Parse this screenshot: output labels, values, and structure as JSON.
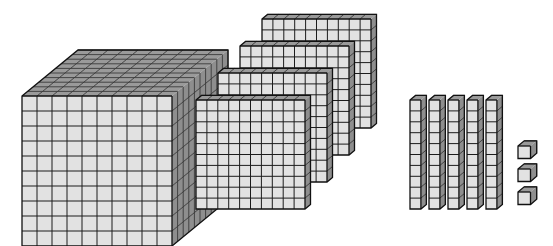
{
  "figure": {
    "background_color": "#ffffff",
    "palette": {
      "front_face": "#e2e2e2",
      "top_face": "#9a9a9a",
      "side_face": "#8e8e8e",
      "edge": "#1c1c1c",
      "outline": "#111111"
    },
    "groups": [
      {
        "name": "thousands-cube",
        "block_type": "cube",
        "count": 1,
        "unit_value": 1000,
        "group_value": 1000,
        "rows": 10,
        "cols": 10,
        "depth": 10
      },
      {
        "name": "hundreds-flats",
        "block_type": "flat",
        "count": 4,
        "unit_value": 100,
        "group_value": 400,
        "rows": 10,
        "cols": 10,
        "depth": 1
      },
      {
        "name": "tens-rods",
        "block_type": "rod",
        "count": 5,
        "unit_value": 10,
        "group_value": 50,
        "rows": 10,
        "cols": 1,
        "depth": 1
      },
      {
        "name": "ones-units",
        "block_type": "unit",
        "count": 3,
        "unit_value": 1,
        "group_value": 3,
        "rows": 1,
        "cols": 1,
        "depth": 1
      }
    ],
    "total_value": 1453
  },
  "chart_data": {
    "type": "bar",
    "xlabel": "",
    "ylabel": "",
    "categories": [
      "Thousands",
      "Hundreds",
      "Tens",
      "Ones"
    ],
    "values": [
      1,
      4,
      5,
      3
    ],
    "place_values": [
      1000,
      100,
      10,
      1
    ],
    "group_totals": [
      1000,
      400,
      50,
      3
    ],
    "total": 1453,
    "legend": [],
    "grid": false
  },
  "geometry": {
    "cube": {
      "x": 22,
      "y": 96,
      "cell": 15,
      "dx": 5.6,
      "dy": -4.6,
      "n": 10
    },
    "flats": [
      {
        "x": 196,
        "y": 100
      },
      {
        "x": 218,
        "y": 73
      },
      {
        "x": 240,
        "y": 46
      },
      {
        "x": 262,
        "y": 19
      }
    ],
    "flat": {
      "cell": 10.9,
      "dx": 5.5,
      "dy": -4.6,
      "n": 10
    },
    "rods": [
      {
        "x": 410,
        "y": 100
      },
      {
        "x": 429,
        "y": 100
      },
      {
        "x": 448,
        "y": 100
      },
      {
        "x": 467,
        "y": 100
      },
      {
        "x": 486,
        "y": 100
      }
    ],
    "rod": {
      "cell": 10.9,
      "dx": 5.5,
      "dy": -4.6,
      "n": 10
    },
    "units": [
      {
        "x": 518,
        "y": 146
      },
      {
        "x": 518,
        "y": 169
      },
      {
        "x": 518,
        "y": 192
      }
    ],
    "unit": {
      "cell": 12.5,
      "dx": 6.2,
      "dy": -5.2
    }
  }
}
